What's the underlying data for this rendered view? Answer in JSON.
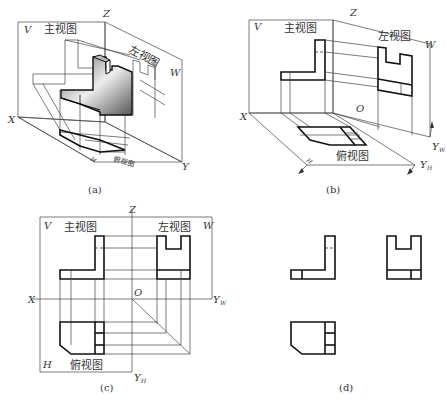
{
  "figure": {
    "panels": [
      {
        "id": "a",
        "caption": "(a)",
        "description": "Isometric view of L-shaped block with notch placed within three-plane projection system (V, H, W)",
        "plane_labels": {
          "V": "V",
          "W": "W",
          "H": "H"
        },
        "axis_labels": {
          "X": "X",
          "Y": "Y",
          "Z": "Z"
        },
        "view_labels": {
          "front": "主视图",
          "left": "左视图",
          "top": "俯视图"
        }
      },
      {
        "id": "b",
        "caption": "(b)",
        "description": "Projections on V, W, H planes with H and W planes being rotated open",
        "plane_labels": {
          "V": "V",
          "W": "W",
          "H": "H"
        },
        "axis_labels": {
          "X": "X",
          "Z": "Z",
          "O": "O",
          "YW": "Y",
          "YW_sub": "W",
          "YH": "Y",
          "YH_sub": "H"
        },
        "view_labels": {
          "front": "主视图",
          "left": "左视图",
          "top": "俯视图"
        }
      },
      {
        "id": "c",
        "caption": "(c)",
        "description": "Planes unfolded into one plane showing three views with projection lines and 45° miter line",
        "plane_labels": {
          "V": "V",
          "W": "W",
          "H": "H"
        },
        "axis_labels": {
          "X": "X",
          "Z": "Z",
          "O": "O",
          "YW": "Y",
          "YW_sub": "W",
          "YH": "Y",
          "YH_sub": "H"
        },
        "view_labels": {
          "front": "主视图",
          "left": "左视图",
          "top": "俯视图"
        }
      },
      {
        "id": "d",
        "caption": "(d)",
        "description": "Final three-view drawing without planes, axes, or projection lines"
      }
    ]
  }
}
